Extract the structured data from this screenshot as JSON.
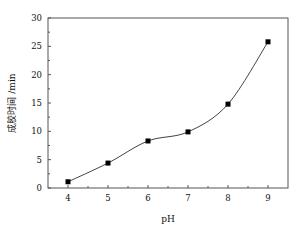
{
  "chart_data": {
    "type": "scatter",
    "title": "",
    "xlabel": "pH",
    "ylabel": "成胶时间 /min",
    "x": [
      4,
      5,
      6,
      7,
      8,
      9
    ],
    "series": [
      {
        "name": "成胶时间",
        "marker": "square",
        "values": [
          1.1,
          4.4,
          8.3,
          9.9,
          14.8,
          25.8
        ]
      }
    ],
    "fit_curve": "smooth trend line through points",
    "xlim": [
      3.5,
      9.5
    ],
    "ylim": [
      0,
      30
    ],
    "xticks": [
      "4",
      "5",
      "6",
      "7",
      "8",
      "9"
    ],
    "yticks": [
      "0",
      "5",
      "10",
      "15",
      "20",
      "25",
      "30"
    ],
    "grid": false,
    "legend": "none"
  },
  "colors": {
    "line": "#444444",
    "marker": "#000000",
    "frame": "#555555"
  }
}
